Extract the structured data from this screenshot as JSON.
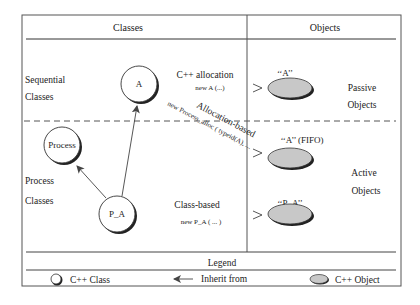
{
  "header": {
    "classes": "Classes",
    "objects": "Objects"
  },
  "rows": {
    "sequential": {
      "line1": "Sequential",
      "line2": "Classes"
    },
    "process": {
      "line1": "Process",
      "line2": "Classes"
    },
    "passive": {
      "line1": "Passive",
      "line2": "Objects"
    },
    "active": {
      "line1": "Active",
      "line2": "Objects"
    }
  },
  "classes": [
    {
      "id": "A",
      "label": "A"
    },
    {
      "id": "Process",
      "label": "Process"
    },
    {
      "id": "P_A",
      "label": "P_A"
    }
  ],
  "allocations": {
    "cpp": {
      "title": "C++ allocation",
      "code": "new  A (...)"
    },
    "allocation_based": {
      "title": "Allocation-based",
      "code": "new Process_alloc ( typeid(A), ..."
    },
    "class_based": {
      "title": "Class-based",
      "code": "new  P_A ( ... )"
    }
  },
  "objects": [
    {
      "id": "obj-a",
      "label": "‘‘A’’"
    },
    {
      "id": "obj-a-fifo",
      "label": "‘‘A’’ (FIFO)"
    },
    {
      "id": "obj-p-a",
      "label": "‘‘P_A’’"
    }
  ],
  "legend": {
    "title": "Legend",
    "class_label": "C++ Class",
    "inherit_label": "Inherit from",
    "object_label": "C++ Object"
  },
  "colors": {
    "object_fill": "#c8c8c8",
    "line": "#444444"
  }
}
